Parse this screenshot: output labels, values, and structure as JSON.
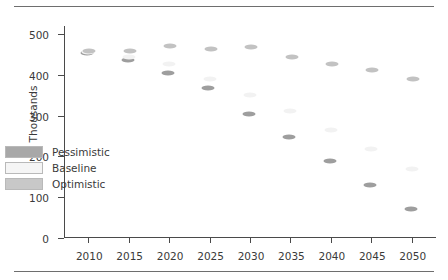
{
  "chart_data": {
    "type": "scatter",
    "title": "",
    "subtitle": "",
    "xlabel": "",
    "ylabel": "Thousands",
    "x": [
      2010,
      2015,
      2020,
      2025,
      2030,
      2035,
      2040,
      2045,
      2050
    ],
    "categories": [
      "2010",
      "2015",
      "2020",
      "2025",
      "2030",
      "2035",
      "2040",
      "2045",
      "2050"
    ],
    "xlim": [
      2007,
      2053
    ],
    "ylim": [
      0,
      520
    ],
    "yticks": [
      0,
      100,
      200,
      300,
      400,
      500
    ],
    "ytick_labels": [
      "0",
      "100",
      "200",
      "300",
      "400",
      "500"
    ],
    "xticks": [
      2010,
      2015,
      2020,
      2025,
      2030,
      2035,
      2040,
      2045,
      2050
    ],
    "xtick_labels": [
      "2010",
      "2015",
      "2020",
      "2025",
      "2030",
      "2035",
      "2040",
      "2045",
      "2050"
    ],
    "grid": false,
    "legend_position": "lower-left",
    "series": [
      {
        "name": "Pessimistic",
        "color": "#9e9e9e",
        "values": [
          455,
          437,
          405,
          367,
          304,
          248,
          190,
          131,
          70
        ]
      },
      {
        "name": "Baseline",
        "color": "#f2f2f2",
        "values": [
          457,
          443,
          427,
          389,
          350,
          311,
          266,
          218,
          170
        ]
      },
      {
        "name": "Optimistic",
        "color": "#c2c2c2",
        "values": [
          458,
          458,
          470,
          463,
          468,
          443,
          427,
          412,
          391
        ]
      }
    ]
  },
  "legend": {
    "items": [
      {
        "label": "Pessimistic",
        "color": "#a8a8a8"
      },
      {
        "label": "Baseline",
        "color": "#f5f5f5"
      },
      {
        "label": "Optimistic",
        "color": "#c8c8c8"
      }
    ]
  },
  "axis": {
    "y_title": "Thousands"
  }
}
